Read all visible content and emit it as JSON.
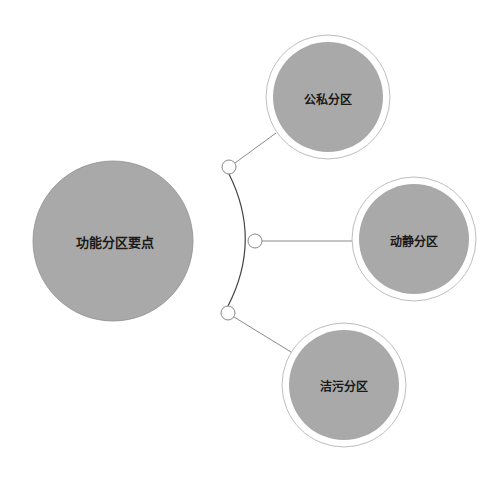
{
  "colors": {
    "background": "#ffffff",
    "circle_fill": "#a9a9a9",
    "ring_stroke": "#bdbdbd",
    "arc_stroke": "#444444",
    "connector_stroke": "#8a8a8a",
    "node_stroke": "#888888",
    "text": "#1a1a1a"
  },
  "center_node": {
    "label": "功能分区要点",
    "cx": 113,
    "cy": 241,
    "r": 80
  },
  "branches": [
    {
      "label": "公私分区",
      "cx": 328,
      "cy": 97,
      "r_outer": 62,
      "r_inner": 55,
      "node": {
        "cx": 229,
        "cy": 167,
        "r": 7
      }
    },
    {
      "label": "动静分区",
      "cx": 414,
      "cy": 239,
      "r_outer": 62,
      "r_inner": 55,
      "node": {
        "cx": 255,
        "cy": 241,
        "r": 7
      }
    },
    {
      "label": "洁污分区",
      "cx": 344,
      "cy": 385,
      "r_outer": 62,
      "r_inner": 55,
      "node": {
        "cx": 228,
        "cy": 313,
        "r": 7
      }
    }
  ]
}
